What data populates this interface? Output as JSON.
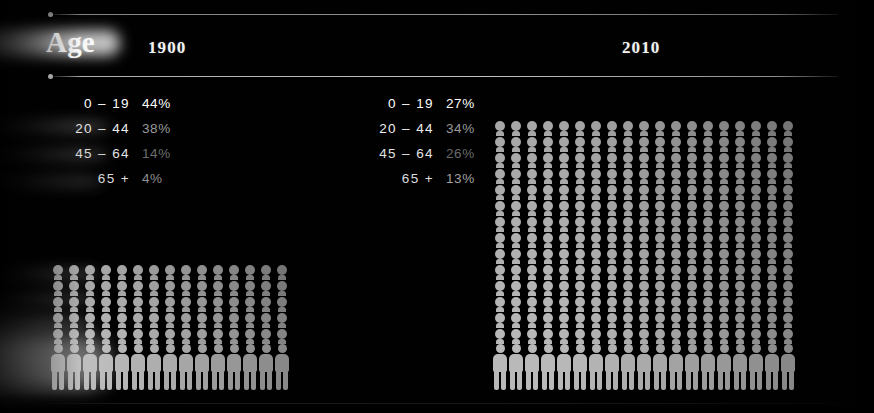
{
  "slide": {
    "background_color": "#000000",
    "title": "Age",
    "panels": [
      {
        "year_label": "1900"
      },
      {
        "year_label": "2010"
      }
    ]
  },
  "header": {
    "age_label": "Age",
    "year_1900": "1900",
    "year_2010": "2010"
  },
  "legends": {
    "panel_1900": {
      "rows": [
        {
          "range": "0 – 19",
          "percent": "44%"
        },
        {
          "range": "20 – 44",
          "percent": "38%"
        },
        {
          "range": "45 – 64",
          "percent": "14%"
        },
        {
          "range": "65 +",
          "percent": "4%"
        }
      ]
    },
    "panel_2010": {
      "rows": [
        {
          "range": "0 – 19",
          "percent": "27%"
        },
        {
          "range": "20 – 44",
          "percent": "34%"
        },
        {
          "range": "45 – 64",
          "percent": "26%"
        },
        {
          "range": "65 +",
          "percent": "13%"
        }
      ]
    }
  },
  "chart_data": {
    "type": "bar",
    "title": "Age",
    "subtitle": "",
    "xlabel": "",
    "ylabel": "Share of population (%)",
    "categories": [
      "0 – 19",
      "20 – 44",
      "45 – 64",
      "65 +"
    ],
    "series": [
      {
        "name": "1900",
        "values": [
          44,
          38,
          14,
          4
        ]
      },
      {
        "name": "2010",
        "values": [
          27,
          34,
          26,
          13
        ]
      }
    ],
    "units": "percent",
    "ylim": [
      0,
      100
    ],
    "grid": false,
    "legend_position": "inline-left"
  },
  "pictograms": {
    "panel_1900": {
      "columns": 15,
      "rows": 6,
      "figure_color": "#b9b9b9",
      "bottom_row_full_figures": true
    },
    "panel_2010": {
      "columns": 19,
      "rows": 15,
      "figure_color": "#b9b9b9",
      "bottom_row_full_figures": true
    }
  },
  "colors": {
    "background": "#000000",
    "rule": "#cfcfcf",
    "text_primary": "#ffffff",
    "text_dim": "#6e6e6e",
    "figure": "#b9b9b9"
  }
}
